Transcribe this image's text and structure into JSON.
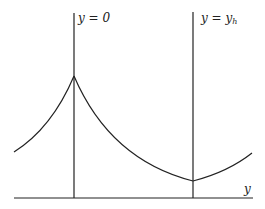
{
  "diagram": {
    "labels": {
      "left_line": "y = 0",
      "right_line": "y = y",
      "right_line_sub": "h",
      "axis": "y"
    },
    "colors": {
      "stroke": "#222222",
      "background": "#ffffff"
    }
  }
}
